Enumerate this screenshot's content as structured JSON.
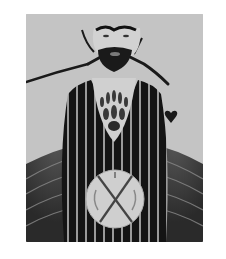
{
  "artwork": {
    "description": "Monochrome painting of a bearded figure in a dark striped robe with outstretched arms, a circle marked with an X on the robe, and a small heart at right",
    "colors": {
      "background": "#c4c4c4",
      "robe": "#141414",
      "stripes": "#9a9a9a",
      "skin": "#d2d2d2",
      "ink": "#1a1a1a",
      "medallion": "#cfcfcf"
    },
    "elements": [
      "face",
      "brows",
      "beard",
      "arms",
      "chest-flames",
      "striped-robe",
      "x-medallion",
      "heart",
      "lower-drapery"
    ]
  }
}
